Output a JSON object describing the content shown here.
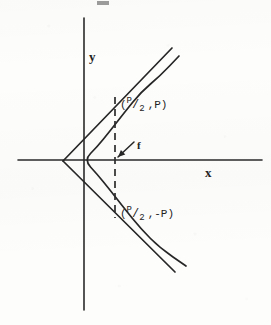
{
  "figure": {
    "type": "parabola-with-tangent-lines-diagram",
    "canvas": {
      "width": 271,
      "height": 325,
      "background": "#fdfdfc"
    },
    "ink_color": "#262626",
    "axes": {
      "x_axis": {
        "label": "x",
        "y_px": 160,
        "x_start_px": 18,
        "x_end_px": 262,
        "label_x_px": 205,
        "label_y_px": 166
      },
      "y_axis": {
        "label": "y",
        "x_px": 84,
        "y_start_px": 18,
        "y_end_px": 310,
        "label_x_px": 89,
        "label_y_px": 50
      },
      "origin_px": {
        "x": 84,
        "y": 160
      }
    },
    "curve": {
      "name": "parabola",
      "equation_form": "y^2 = 2Px",
      "opens": "right",
      "vertex_px": {
        "x": 84,
        "y": 160
      },
      "points_px": [
        {
          "x": 179,
          "y": 56
        },
        {
          "x": 160,
          "y": 76
        },
        {
          "x": 141,
          "y": 92
        },
        {
          "x": 124,
          "y": 113
        },
        {
          "x": 110,
          "y": 131
        },
        {
          "x": 97,
          "y": 147
        },
        {
          "x": 84,
          "y": 160
        },
        {
          "x": 97,
          "y": 174
        },
        {
          "x": 110,
          "y": 190
        },
        {
          "x": 124,
          "y": 208
        },
        {
          "x": 141,
          "y": 229
        },
        {
          "x": 160,
          "y": 248
        },
        {
          "x": 186,
          "y": 266
        }
      ]
    },
    "tangent_lines": [
      {
        "name": "upper-tangent",
        "from_px": {
          "x": 63,
          "y": 161
        },
        "to_px": {
          "x": 172,
          "y": 48
        },
        "touch_point_px": {
          "x": 115,
          "y": 97
        }
      },
      {
        "name": "lower-tangent",
        "from_px": {
          "x": 63,
          "y": 161
        },
        "to_px": {
          "x": 175,
          "y": 272
        },
        "touch_point_px": {
          "x": 115,
          "y": 218
        }
      }
    ],
    "tangent_intersection_px": {
      "x": 63,
      "y": 161
    },
    "dashed_line": {
      "name": "latus-rectum",
      "x_px": 115,
      "y_top_px": 97,
      "y_bottom_px": 218,
      "style": "dashed"
    },
    "focus": {
      "label": "f",
      "point_px": {
        "x": 115,
        "y": 160
      },
      "label_x_px": 137,
      "label_y_px": 140,
      "arrow_from_px": {
        "x": 134,
        "y": 142
      },
      "arrow_to_px": {
        "x": 118,
        "y": 157
      }
    },
    "point_labels": [
      {
        "name": "upper-point-label",
        "numerator": "P",
        "slash": "/",
        "denominator": "2",
        "second_coord": "P",
        "open_paren": "(",
        "comma": ",",
        "close_paren": ")",
        "x_px": 120,
        "y_px": 99
      },
      {
        "name": "lower-point-label",
        "numerator": "P",
        "slash": "/",
        "denominator": "2",
        "second_coord": "-P",
        "open_paren": "(",
        "comma": ",",
        "close_paren": ")",
        "x_px": 120,
        "y_px": 208
      }
    ]
  }
}
